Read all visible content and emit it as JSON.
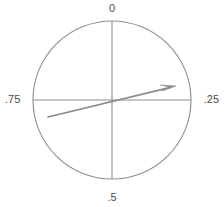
{
  "figure": {
    "background_color": "#ffffff",
    "stroke_color": "#8d8d8d",
    "arrow_color": "#8a8a8a",
    "label_color": "#4a4a4a"
  },
  "labels": {
    "top": "0",
    "right": ".25",
    "bottom": ".5",
    "left": ".75"
  },
  "chart_data": {
    "type": "scatter",
    "title": "",
    "subtitle": "",
    "xlabel": "",
    "ylabel": "",
    "grid": false,
    "legend_position": "none",
    "circle": {
      "center_x": 112,
      "center_y": 100,
      "radius": 79,
      "stroke": "#8d8d8d",
      "stroke_width": 1,
      "fill": "none"
    },
    "axes": [
      {
        "name": "vertical-axis",
        "x1": 112,
        "y1": 21,
        "x2": 112,
        "y2": 179
      },
      {
        "name": "horizontal-axis",
        "x1": 33,
        "y1": 100,
        "x2": 191,
        "y2": 100
      }
    ],
    "tick_labels": [
      "0",
      ".25",
      ".5",
      ".75"
    ],
    "tick_values": [
      0,
      0.25,
      0.5,
      0.75
    ],
    "tick_positions": [
      "top",
      "right",
      "bottom",
      "left"
    ],
    "categories": [
      "0",
      ".25",
      ".5",
      ".75"
    ],
    "values": [
      0,
      0.25,
      0.5,
      0.75
    ],
    "series": [
      {
        "name": "vector",
        "tail_x": 48,
        "tail_y": 117,
        "tip_x": 176,
        "tip_y": 86,
        "angle_turns": 0.22,
        "angle_degrees": 76.4,
        "length_px": 131.7,
        "color": "#8a8a8a"
      }
    ],
    "xlim": [
      0,
      224
    ],
    "ylim": [
      0,
      207
    ]
  }
}
